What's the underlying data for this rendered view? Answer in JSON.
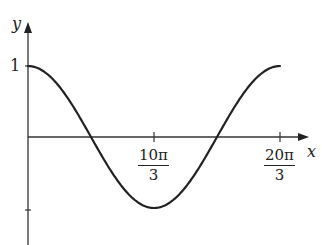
{
  "chart_data": {
    "type": "line",
    "title": "",
    "xlabel": "x",
    "ylabel": "y",
    "function": "y = cos(3x/10)",
    "x_tick_labels": [
      {
        "value": 10.472,
        "num": "10π",
        "den": "3"
      },
      {
        "value": 20.944,
        "num": "20π",
        "den": "3"
      }
    ],
    "y_tick_labels": [
      {
        "value": 1,
        "label": "1"
      },
      {
        "value": -1,
        "label": ""
      }
    ],
    "x": [
      0,
      2.618,
      5.236,
      7.854,
      10.472,
      13.09,
      15.708,
      18.326,
      20.944
    ],
    "y": [
      1,
      0.707,
      0,
      -0.707,
      -1,
      -0.707,
      0,
      0.707,
      1
    ],
    "xlim": [
      0,
      24
    ],
    "ylim": [
      -1.5,
      1.55
    ],
    "grid": false,
    "legend": null,
    "colors": {
      "curve": "#222222",
      "axes": "#333333"
    }
  },
  "labels": {
    "y_axis": "y",
    "x_axis": "x",
    "y_one": "1",
    "tick1_num": "10π",
    "tick1_den": "3",
    "tick2_num": "20π",
    "tick2_den": "3"
  }
}
